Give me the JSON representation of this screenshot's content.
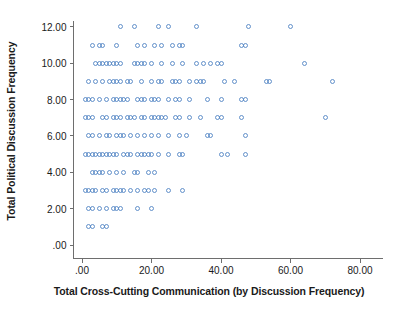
{
  "chart_data": {
    "type": "scatter",
    "title": "",
    "xlabel": "Total Cross-Cutting Communication (by Discussion Frequency)",
    "ylabel": "Total Political Discussion Frequency",
    "xlim": [
      -4,
      86
    ],
    "ylim": [
      -0.6,
      12.8
    ],
    "grid": false,
    "legend": null,
    "marker": {
      "shape": "open-circle",
      "color": "#4a7fc1",
      "size_px": 5,
      "opacity": 0.85
    },
    "xticks": [
      0,
      20,
      40,
      60,
      80
    ],
    "xtick_labels": [
      ".00",
      "20.00",
      "40.00",
      "60.00",
      "80.00"
    ],
    "yticks": [
      0,
      2,
      4,
      6,
      8,
      10,
      12
    ],
    "ytick_labels": [
      ".00",
      "2.00",
      "4.00",
      "6.00",
      "8.00",
      "10.00",
      "12.00"
    ],
    "points": [
      [
        11,
        12
      ],
      [
        15,
        12
      ],
      [
        22,
        12
      ],
      [
        25,
        12
      ],
      [
        33,
        12
      ],
      [
        48,
        12
      ],
      [
        60,
        12
      ],
      [
        3,
        11
      ],
      [
        5,
        11
      ],
      [
        6,
        11
      ],
      [
        10,
        11
      ],
      [
        16,
        11
      ],
      [
        18,
        11
      ],
      [
        21,
        11
      ],
      [
        23,
        11
      ],
      [
        26,
        11
      ],
      [
        28,
        11
      ],
      [
        29,
        11
      ],
      [
        46,
        11
      ],
      [
        47,
        11
      ],
      [
        4,
        10
      ],
      [
        5,
        10
      ],
      [
        6,
        10
      ],
      [
        7,
        10
      ],
      [
        8,
        10
      ],
      [
        9,
        10
      ],
      [
        10,
        10
      ],
      [
        11,
        10
      ],
      [
        15,
        10
      ],
      [
        16,
        10
      ],
      [
        17,
        10
      ],
      [
        18,
        10
      ],
      [
        20,
        10
      ],
      [
        23,
        10
      ],
      [
        26,
        10
      ],
      [
        29,
        10
      ],
      [
        33,
        10
      ],
      [
        35,
        10
      ],
      [
        37,
        10
      ],
      [
        39,
        10
      ],
      [
        40,
        10
      ],
      [
        64,
        10
      ],
      [
        2,
        9
      ],
      [
        4,
        9
      ],
      [
        6,
        9
      ],
      [
        8,
        9
      ],
      [
        9,
        9
      ],
      [
        10,
        9
      ],
      [
        11,
        9
      ],
      [
        13,
        9
      ],
      [
        14,
        9
      ],
      [
        17,
        9
      ],
      [
        20,
        9
      ],
      [
        22,
        9
      ],
      [
        23,
        9
      ],
      [
        26,
        9
      ],
      [
        27,
        9
      ],
      [
        28,
        9
      ],
      [
        31,
        9
      ],
      [
        33,
        9
      ],
      [
        34,
        9
      ],
      [
        35,
        9
      ],
      [
        41,
        9
      ],
      [
        44,
        9
      ],
      [
        53,
        9
      ],
      [
        54,
        9
      ],
      [
        72,
        9
      ],
      [
        1,
        8
      ],
      [
        2,
        8
      ],
      [
        3,
        8
      ],
      [
        5,
        8
      ],
      [
        7,
        8
      ],
      [
        9,
        8
      ],
      [
        10,
        8
      ],
      [
        11,
        8
      ],
      [
        12,
        8
      ],
      [
        13,
        8
      ],
      [
        16,
        8
      ],
      [
        17,
        8
      ],
      [
        18,
        8
      ],
      [
        20,
        8
      ],
      [
        21,
        8
      ],
      [
        22,
        8
      ],
      [
        25,
        8
      ],
      [
        27,
        8
      ],
      [
        28,
        8
      ],
      [
        31,
        8
      ],
      [
        36,
        8
      ],
      [
        40,
        8
      ],
      [
        46,
        8
      ],
      [
        47,
        8
      ],
      [
        1,
        7
      ],
      [
        2,
        7
      ],
      [
        3,
        7
      ],
      [
        6,
        7
      ],
      [
        7,
        7
      ],
      [
        9,
        7
      ],
      [
        10,
        7
      ],
      [
        11,
        7
      ],
      [
        13,
        7
      ],
      [
        14,
        7
      ],
      [
        15,
        7
      ],
      [
        17,
        7
      ],
      [
        18,
        7
      ],
      [
        20,
        7
      ],
      [
        21,
        7
      ],
      [
        22,
        7
      ],
      [
        23,
        7
      ],
      [
        24,
        7
      ],
      [
        27,
        7
      ],
      [
        28,
        7
      ],
      [
        31,
        7
      ],
      [
        34,
        7
      ],
      [
        39,
        7
      ],
      [
        40,
        7
      ],
      [
        46,
        7
      ],
      [
        70,
        7
      ],
      [
        2,
        6
      ],
      [
        3,
        6
      ],
      [
        5,
        6
      ],
      [
        7,
        6
      ],
      [
        8,
        6
      ],
      [
        10,
        6
      ],
      [
        11,
        6
      ],
      [
        12,
        6
      ],
      [
        14,
        6
      ],
      [
        16,
        6
      ],
      [
        18,
        6
      ],
      [
        20,
        6
      ],
      [
        22,
        6
      ],
      [
        25,
        6
      ],
      [
        28,
        6
      ],
      [
        30,
        6
      ],
      [
        36,
        6
      ],
      [
        37,
        6
      ],
      [
        47,
        6
      ],
      [
        1,
        5
      ],
      [
        2,
        5
      ],
      [
        3,
        5
      ],
      [
        4,
        5
      ],
      [
        5,
        5
      ],
      [
        6,
        5
      ],
      [
        7,
        5
      ],
      [
        8,
        5
      ],
      [
        9,
        5
      ],
      [
        10,
        5
      ],
      [
        12,
        5
      ],
      [
        13,
        5
      ],
      [
        14,
        5
      ],
      [
        16,
        5
      ],
      [
        17,
        5
      ],
      [
        18,
        5
      ],
      [
        19,
        5
      ],
      [
        20,
        5
      ],
      [
        22,
        5
      ],
      [
        25,
        5
      ],
      [
        28,
        5
      ],
      [
        29,
        5
      ],
      [
        40,
        5
      ],
      [
        42,
        5
      ],
      [
        47,
        5
      ],
      [
        3,
        4
      ],
      [
        4,
        4
      ],
      [
        5,
        4
      ],
      [
        6,
        4
      ],
      [
        8,
        4
      ],
      [
        10,
        4
      ],
      [
        12,
        4
      ],
      [
        15,
        4
      ],
      [
        16,
        4
      ],
      [
        19,
        4
      ],
      [
        21,
        4
      ],
      [
        1,
        3
      ],
      [
        2,
        3
      ],
      [
        3,
        3
      ],
      [
        4,
        3
      ],
      [
        6,
        3
      ],
      [
        7,
        3
      ],
      [
        9,
        3
      ],
      [
        10,
        3
      ],
      [
        11,
        3
      ],
      [
        12,
        3
      ],
      [
        14,
        3
      ],
      [
        16,
        3
      ],
      [
        18,
        3
      ],
      [
        19,
        3
      ],
      [
        21,
        3
      ],
      [
        25,
        3
      ],
      [
        29,
        3
      ],
      [
        2,
        2
      ],
      [
        3,
        2
      ],
      [
        5,
        2
      ],
      [
        7,
        2
      ],
      [
        9,
        2
      ],
      [
        10,
        2
      ],
      [
        11,
        2
      ],
      [
        16,
        2
      ],
      [
        20,
        2
      ],
      [
        2,
        1
      ],
      [
        3,
        1
      ],
      [
        6,
        1
      ],
      [
        7,
        1
      ]
    ]
  }
}
